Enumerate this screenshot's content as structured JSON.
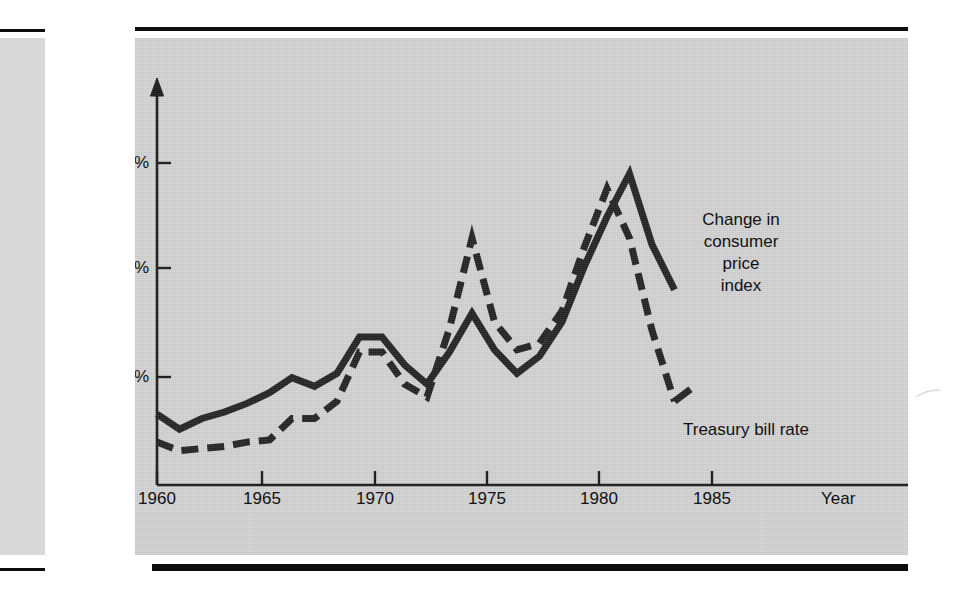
{
  "figure": {
    "axis_label_y": "Annual\nrate (%)",
    "axis_label_x": "Year",
    "y_ticks": [
      "15%",
      "10%",
      "5%"
    ],
    "x_ticks": [
      "1960",
      "1965",
      "1970",
      "1975",
      "1980",
      "1985"
    ],
    "series_label_cpi": "Change in\nconsumer\nprice\nindex",
    "series_label_tbill": "Treasury bill rate",
    "panel_color": "#d6d6d6",
    "ink_color": "#1a1a1a",
    "page_color": "#ffffff"
  },
  "chart_data": {
    "type": "line",
    "title": "",
    "xlabel": "Year",
    "ylabel": "Annual rate (%)",
    "xlim": [
      1960,
      1987
    ],
    "ylim": [
      0,
      17
    ],
    "y_ticks": [
      5,
      10,
      15
    ],
    "y_tick_labels": [
      "5%",
      "10%",
      "15%"
    ],
    "x_ticks": [
      1960,
      1965,
      1970,
      1975,
      1980,
      1985
    ],
    "grid": false,
    "legend": "inline-annotation",
    "series": [
      {
        "name": "Change in consumer price index",
        "style": "solid",
        "x": [
          1960,
          1961,
          1962,
          1963,
          1964,
          1965,
          1966,
          1967,
          1968,
          1969,
          1970,
          1971,
          1972,
          1973,
          1974,
          1975,
          1976,
          1977,
          1978,
          1979,
          1980,
          1981,
          1982,
          1983
        ],
        "values": [
          3.3,
          2.6,
          3.1,
          3.4,
          3.8,
          4.3,
          5.0,
          4.6,
          5.2,
          6.9,
          6.9,
          5.6,
          4.7,
          6.2,
          8.0,
          6.3,
          5.2,
          6.0,
          7.6,
          10.2,
          12.5,
          14.5,
          11.2,
          9.1
        ]
      },
      {
        "name": "Treasury bill rate",
        "style": "dashed",
        "x": [
          1960,
          1961,
          1962,
          1963,
          1964,
          1965,
          1966,
          1967,
          1968,
          1969,
          1970,
          1971,
          1972,
          1973,
          1974,
          1975,
          1976,
          1977,
          1978,
          1979,
          1980,
          1981,
          1982,
          1983
        ],
        "values": [
          2.0,
          1.6,
          1.7,
          1.8,
          2.0,
          2.1,
          3.1,
          3.1,
          3.9,
          6.2,
          6.2,
          4.7,
          4.1,
          7.3,
          11.5,
          7.6,
          6.3,
          6.6,
          8.1,
          11.1,
          13.8,
          11.5,
          7.2,
          3.9
        ]
      }
    ]
  }
}
